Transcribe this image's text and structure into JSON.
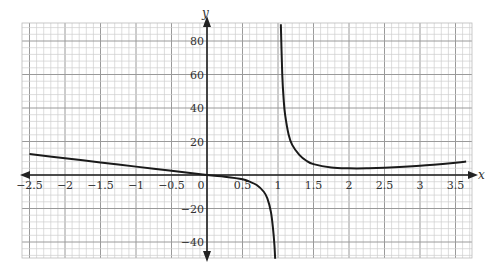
{
  "chart_data": {
    "type": "line",
    "title": "",
    "xlabel": "x",
    "ylabel": "y",
    "xlim": [
      -2.5,
      3.65
    ],
    "ylim": [
      -50,
      90
    ],
    "grid": true,
    "x_ticks": [
      "-2.5",
      "-2",
      "-1.5",
      "-1",
      "-0.5",
      "0",
      "0.5",
      "1",
      "1.5",
      "2",
      "2.5",
      "3",
      "3.5"
    ],
    "x_tick_values": [
      -2.5,
      -2,
      -1.5,
      -1,
      -0.5,
      0,
      0.5,
      1,
      1.5,
      2,
      2.5,
      3,
      3.5
    ],
    "y_ticks": [
      "80",
      "60",
      "40",
      "20",
      "-20",
      "-40"
    ],
    "y_tick_values": [
      80,
      60,
      40,
      20,
      -20,
      -40
    ],
    "vertical_asymptote": 1,
    "series": [
      {
        "name": "left branch",
        "x": [
          -2.5,
          -2,
          -1.5,
          -1,
          -0.5,
          0,
          0.25,
          0.5,
          0.6,
          0.7,
          0.8,
          0.85,
          0.9,
          0.93,
          0.95,
          0.96
        ],
        "y": [
          12.5,
          10,
          7.5,
          5,
          2.5,
          0,
          -1,
          -2.5,
          -4,
          -6,
          -10,
          -14,
          -22,
          -32,
          -42,
          -50
        ]
      },
      {
        "name": "right branch",
        "x": [
          1.04,
          1.06,
          1.08,
          1.1,
          1.15,
          1.2,
          1.3,
          1.4,
          1.5,
          1.75,
          2,
          2.25,
          2.5,
          3,
          3.5,
          3.65
        ],
        "y": [
          90,
          60,
          45,
          36,
          24,
          18,
          12,
          8.5,
          6.5,
          4.5,
          4,
          4,
          4.3,
          5.5,
          7.3,
          8
        ]
      }
    ]
  },
  "labels": {
    "x_axis": "x",
    "y_axis": "y"
  }
}
